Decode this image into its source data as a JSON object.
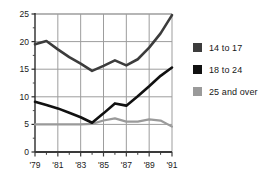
{
  "chart_data": {
    "type": "line",
    "title": "",
    "xlabel": "",
    "ylabel": "",
    "x": [
      1979,
      1980,
      1981,
      1982,
      1983,
      1984,
      1985,
      1986,
      1987,
      1988,
      1989,
      1990,
      1991
    ],
    "xtick_labels": [
      "'79",
      "'81",
      "'83",
      "'85",
      "'87",
      "'89",
      "'91"
    ],
    "xtick_values": [
      1979,
      1981,
      1983,
      1985,
      1987,
      1989,
      1991
    ],
    "ytick_labels": [
      "0",
      "5",
      "10",
      "15",
      "20",
      "25"
    ],
    "ytick_values": [
      0,
      5,
      10,
      15,
      20,
      25
    ],
    "xlim": [
      1979,
      1991
    ],
    "ylim": [
      0,
      25
    ],
    "grid": "both",
    "legend_position": "right",
    "series": [
      {
        "name": "14 to 17",
        "color": "#3c3c3c",
        "values": [
          19.5,
          20.1,
          18.6,
          17.2,
          16.0,
          14.7,
          15.6,
          16.6,
          15.7,
          16.8,
          18.9,
          21.5,
          24.8
        ]
      },
      {
        "name": "18 to 24",
        "color": "#111111",
        "values": [
          9.1,
          8.5,
          7.9,
          7.1,
          6.3,
          5.3,
          7.0,
          8.8,
          8.4,
          10.1,
          11.9,
          13.8,
          15.3
        ]
      },
      {
        "name": "25 and over",
        "color": "#9a9a9a",
        "values": [
          5.0,
          5.0,
          5.0,
          5.0,
          5.0,
          5.1,
          5.7,
          6.1,
          5.5,
          5.5,
          5.9,
          5.7,
          4.6
        ]
      }
    ]
  },
  "legend": {
    "items": [
      {
        "label": "14 to 17",
        "color": "#3c3c3c"
      },
      {
        "label": "18 to 24",
        "color": "#111111"
      },
      {
        "label": "25 and over",
        "color": "#9a9a9a"
      }
    ]
  },
  "axes": {
    "y_labels": [
      "25",
      "20",
      "15",
      "10",
      "5",
      "0"
    ],
    "x_labels": [
      "'79",
      "'81",
      "'83",
      "'85",
      "'87",
      "'89",
      "'91"
    ]
  }
}
